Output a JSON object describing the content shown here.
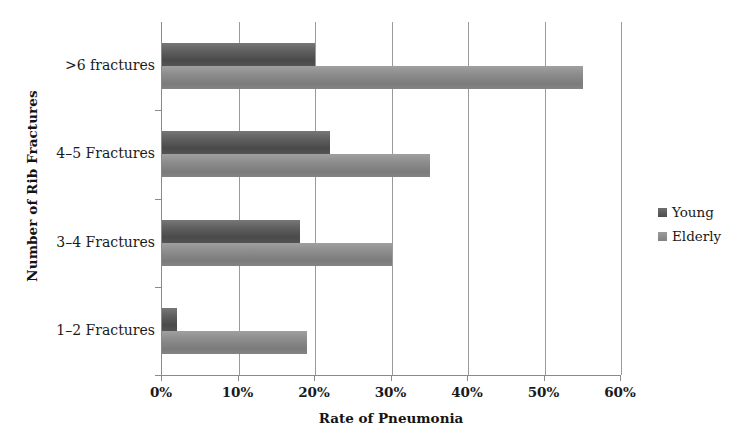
{
  "chart_data": {
    "type": "bar",
    "orientation": "horizontal",
    "title": "",
    "xlabel": "Rate of Pneumonia",
    "ylabel": "Number of Rib Fractures",
    "categories": [
      "1–2 Fractures",
      "3–4 Fractures",
      "4–5 Fractures",
      ">6 fractures"
    ],
    "series": [
      {
        "name": "Young",
        "values": [
          2,
          18,
          22,
          20
        ],
        "color": "#595959"
      },
      {
        "name": "Elderly",
        "values": [
          19,
          30,
          35,
          55
        ],
        "color": "#8c8c8c"
      }
    ],
    "xlim": [
      0,
      60
    ],
    "xtick_labels": [
      "0%",
      "10%",
      "20%",
      "30%",
      "40%",
      "50%",
      "60%"
    ],
    "xtick_values": [
      0,
      10,
      20,
      30,
      40,
      50,
      60
    ],
    "grid": true,
    "grid_axis": "x",
    "legend_position": "right",
    "unit": "%"
  },
  "legend": {
    "items": [
      {
        "label": "Young"
      },
      {
        "label": "Elderly"
      }
    ]
  },
  "axes": {
    "x_title": "Rate of Pneumonia",
    "y_title": "Number of Rib Fractures"
  }
}
